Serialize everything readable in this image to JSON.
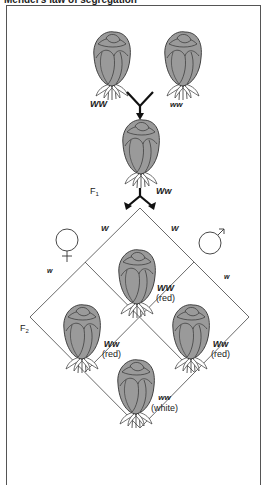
{
  "title": "Mendel's law of segregation",
  "parents": {
    "red": {
      "genotype": "WW",
      "color": "#9a9a9a"
    },
    "white": {
      "genotype": "ww",
      "color": "#ffffff"
    }
  },
  "f1": {
    "label": "F",
    "label_sub": "1",
    "genotype": "Ww"
  },
  "punnett": {
    "female_symbol": "♀",
    "male_symbol": "♂",
    "female_alleles": [
      "W",
      "w"
    ],
    "male_alleles": [
      "W",
      "w"
    ],
    "generation_label": "F",
    "generation_sub": "2",
    "cells": [
      {
        "genotype": "WW",
        "phenotype": "(red)"
      },
      {
        "genotype": "Ww",
        "phenotype": "(red)"
      },
      {
        "genotype": "Ww",
        "phenotype": "(red)"
      },
      {
        "genotype": "ww",
        "phenotype": "(white)"
      }
    ]
  },
  "colors": {
    "red_rose_fill": "#9a9a9a",
    "white_rose_fill": "#ffffff",
    "line": "#333333",
    "frame": "#555555"
  }
}
